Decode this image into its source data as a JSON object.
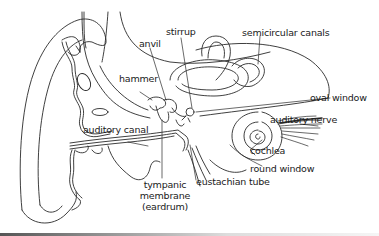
{
  "diagram": {
    "labels": {
      "anvil": "anvil",
      "stirrup": "stirrup",
      "semicircular_canals": "semicircular canals",
      "hammer": "hammer",
      "oval_window": "oval window",
      "auditory_nerve": "auditory nerve",
      "auditory_canal": "auditory canal",
      "cochlea": "cochlea",
      "round_window": "round window",
      "tympanic_membrane_1": "tympanic",
      "tympanic_membrane_2": "membrane",
      "tympanic_membrane_3": "(eardrum)",
      "eustachian_tube": "eustachian tube"
    },
    "colors": {
      "line": "#2a2a2a",
      "background": "#ffffff"
    }
  }
}
